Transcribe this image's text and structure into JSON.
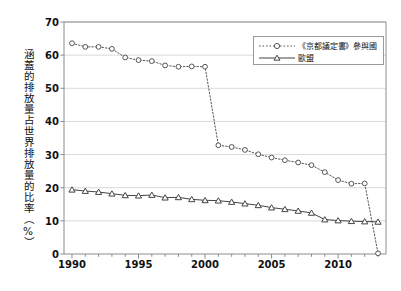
{
  "chart_data": {
    "type": "line",
    "title": "",
    "subtitle": "",
    "xlabel": "",
    "ylabel": "涵蓋的排放量占世界排放量的比率（%）",
    "xlim": [
      1989.4,
      2013.6
    ],
    "ylim": [
      0,
      70
    ],
    "y_ticks": [
      0,
      10,
      20,
      30,
      40,
      50,
      60,
      70
    ],
    "y_tick_labels": [
      "0",
      "10",
      "20",
      "30",
      "40",
      "50",
      "60",
      "70"
    ],
    "x_ticks": [
      1990,
      1995,
      2000,
      2005,
      2010
    ],
    "x_tick_labels": [
      "1990",
      "1995",
      "2000",
      "2005",
      "2010"
    ],
    "x_minor_ticks": [
      1991,
      1992,
      1993,
      1994,
      1996,
      1997,
      1998,
      1999,
      2001,
      2002,
      2003,
      2004,
      2006,
      2007,
      2008,
      2009,
      2011,
      2012,
      2013
    ],
    "grid": "horizontal",
    "grid_color": "#d9d9d9",
    "axis_color": "#8c8c8c",
    "legend_position": "top-right",
    "x": [
      1990,
      1991,
      1992,
      1993,
      1994,
      1995,
      1996,
      1997,
      1998,
      1999,
      2000,
      2001,
      2002,
      2003,
      2004,
      2005,
      2006,
      2007,
      2008,
      2009,
      2010,
      2011,
      2012,
      2013
    ],
    "series": [
      {
        "name": "《京都議定書》參與國",
        "marker": "circle-open",
        "linestyle": "dotted",
        "color": "#555555",
        "values": [
          63.6,
          62.5,
          62.5,
          61.9,
          59.3,
          58.5,
          58.2,
          56.9,
          56.5,
          56.6,
          56.5,
          32.8,
          32.3,
          31.4,
          30.1,
          29.1,
          28.3,
          27.6,
          26.8,
          24.7,
          22.3,
          21.2,
          21.3,
          0.2
        ]
      },
      {
        "name": "歐盟",
        "marker": "triangle-open",
        "linestyle": "solid",
        "color": "#444444",
        "values": [
          19.4,
          19.0,
          18.7,
          18.2,
          17.7,
          17.6,
          17.8,
          17.0,
          17.1,
          16.5,
          16.2,
          16.1,
          15.7,
          15.2,
          14.7,
          14.0,
          13.5,
          13.0,
          12.4,
          10.4,
          10.1,
          9.9,
          9.8,
          9.7
        ]
      }
    ]
  },
  "legend": {
    "items": [
      {
        "label": "《京都議定書》參與國",
        "style": "dotted-circle"
      },
      {
        "label": "歐盟",
        "style": "solid-triangle"
      }
    ]
  },
  "axes": {
    "y_title": "涵蓋的排放量占世界排放量的比率（%）"
  }
}
